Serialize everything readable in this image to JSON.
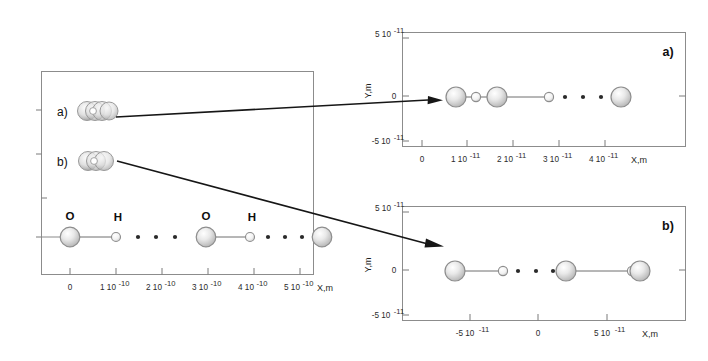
{
  "figure": {
    "kind": "molecular-chain-diagram",
    "background_color": "#ffffff",
    "frame_color": "#8c8c8c",
    "oxygen_color": "#c9c9c9",
    "hydrogen_color": "#e4e4e4",
    "bond_color": "#6e6e6e",
    "pointer_color": "#161616"
  },
  "left_panel": {
    "name": "overview-panel",
    "axis": {
      "xlabel": "X,m",
      "x_ticks": [
        "0",
        "1 10",
        "2 10",
        "3 10",
        "4 10",
        "5 10"
      ],
      "x_tick_exponents": [
        "",
        "-10",
        "-10",
        "-10",
        "-10",
        "-10"
      ],
      "x_tick_values": [
        0,
        1e-10,
        2e-10,
        3e-10,
        4e-10,
        5e-10
      ],
      "y_ticks_labeled": false
    },
    "clusters": [
      {
        "tag": "a)",
        "circle_count": 4
      },
      {
        "tag": "b)",
        "circle_count": 3
      }
    ],
    "main_chain": {
      "atom_labels": [
        "O",
        "H",
        "O",
        "H"
      ],
      "atoms": [
        {
          "element": "O",
          "x_m": 0.0
        },
        {
          "element": "H",
          "x_m": 1e-10
        },
        {
          "element": "O",
          "x_m": 2.95e-10
        },
        {
          "element": "H",
          "x_m": 3.9e-10
        },
        {
          "element": "O",
          "x_m": 5.6e-10
        }
      ],
      "hydrogen_bond_dot_groups": [
        3,
        3
      ]
    }
  },
  "top_right_panel": {
    "name": "detail-panel-a",
    "tag": "a)",
    "axis": {
      "xlabel": "X,m",
      "ylabel": "Y,m",
      "x_ticks": [
        "0",
        "1 10",
        "2 10",
        "3 10",
        "4 10"
      ],
      "x_tick_exponents": [
        "",
        "-11",
        "-11",
        "-11",
        "-11"
      ],
      "x_tick_values": [
        0,
        1e-11,
        2e-11,
        3e-11,
        4e-11
      ],
      "y_ticks": [
        "5 10",
        "0",
        "-5 10"
      ],
      "y_tick_exponents": [
        "-11",
        "",
        "-11"
      ],
      "y_tick_values": [
        5e-11,
        0,
        -5e-11
      ]
    },
    "chain": {
      "atoms": [
        {
          "element": "O",
          "x_m": 7.5e-12
        },
        {
          "element": "H",
          "x_m": 1.15e-11
        },
        {
          "element": "O",
          "x_m": 1.58e-11
        },
        {
          "element": "H",
          "x_m": 2.75e-11
        },
        {
          "element": "O",
          "x_m": 4.05e-11
        }
      ],
      "hydrogen_bond_dot_groups": [
        3
      ]
    }
  },
  "bottom_right_panel": {
    "name": "detail-panel-b",
    "tag": "b)",
    "axis": {
      "xlabel": "X,m",
      "ylabel": "Y,m",
      "x_ticks": [
        "-5 10",
        "0",
        "5 10"
      ],
      "x_tick_exponents": [
        "-11",
        "",
        "-11"
      ],
      "x_tick_values": [
        -5e-11,
        0,
        5e-11
      ],
      "y_ticks": [
        "5 10",
        "0",
        "-5 10"
      ],
      "y_tick_exponents": [
        "-11",
        "",
        "-11"
      ],
      "y_tick_values": [
        5e-11,
        0,
        -5e-11
      ]
    },
    "chain": {
      "atoms": [
        {
          "element": "O",
          "x_m": -5.2e-11
        },
        {
          "element": "H",
          "x_m": -2.6e-11
        },
        {
          "element": "O",
          "x_m": 1.7e-11
        },
        {
          "element": "H",
          "x_m": 7e-11
        },
        {
          "element": "O",
          "x_m": 7.8e-11
        }
      ],
      "hydrogen_bond_dot_groups": [
        3
      ]
    }
  },
  "pointers": [
    {
      "name": "pointer-a",
      "from_cluster": "a)",
      "to_panel": "detail-panel-a"
    },
    {
      "name": "pointer-b",
      "from_cluster": "b)",
      "to_panel": "detail-panel-b"
    }
  ]
}
